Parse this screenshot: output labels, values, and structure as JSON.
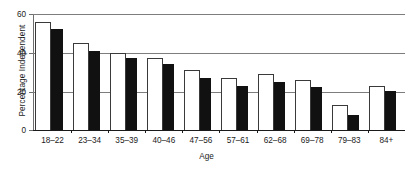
{
  "chart_data": {
    "type": "bar",
    "title": "",
    "xlabel": "Age",
    "ylabel": "Percentage Independent",
    "categories": [
      "18–22",
      "23–34",
      "35–39",
      "40–46",
      "47–56",
      "57–61",
      "62–68",
      "69–78",
      "79–83",
      "84+"
    ],
    "series": [
      {
        "name": "white-bars",
        "style": "white-filled-black-outline",
        "values": [
          56,
          45,
          40,
          37,
          31,
          27,
          29,
          26,
          13,
          23
        ]
      },
      {
        "name": "black-bars",
        "style": "black-filled",
        "values": [
          52,
          41,
          37,
          34,
          27,
          23,
          25,
          22,
          8,
          20
        ]
      }
    ],
    "ylim": [
      0,
      60
    ],
    "yticks": [
      0,
      20,
      40,
      60
    ],
    "ytick_labels": [
      "0",
      "20",
      "40",
      "60"
    ],
    "grid": true,
    "gridlines_at": [
      20,
      40,
      60
    ],
    "legend": null,
    "legend_position": "none"
  },
  "colors": {
    "bar_white_fill": "#ffffff",
    "bar_outline": "#3a3a3a",
    "bar_black_fill": "#111111",
    "axis": "#1a1a1a",
    "gridline": "#7d7d7d",
    "background": "#ffffff",
    "text": "#1a1a1a"
  }
}
